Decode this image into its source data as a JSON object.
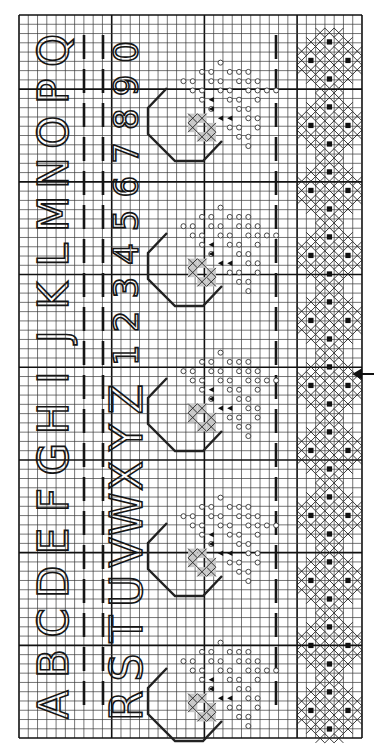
{
  "chart_title": "Cross-stitch alphabet sampler chart (rotated 90°)",
  "grid": {
    "origin_x": 19,
    "origin_y": 15,
    "cell": 9.27,
    "cols": 37,
    "rows": 78,
    "thick_every": 10,
    "line_color": "#3a3a3a",
    "thick_color": "#111111",
    "background": "#ffffff"
  },
  "alphabet_row_1": {
    "letters": [
      "A",
      "B",
      "C",
      "D",
      "E",
      "F",
      "G",
      "H",
      "I",
      "J",
      "K",
      "L",
      "M",
      "N",
      "O",
      "P",
      "Q"
    ],
    "orientation": "rotated -90deg, reading bottom to top",
    "column_center_x": 53
  },
  "alphabet_row_2": {
    "letters": [
      "R",
      "S",
      "T",
      "U",
      "V",
      "W",
      "X",
      "Y",
      "Z"
    ],
    "column_center_x": 126
  },
  "numbers_row": {
    "digits": [
      "1",
      "2",
      "3",
      "4",
      "5",
      "6",
      "7",
      "8",
      "9",
      "0"
    ],
    "column_center_x": 126
  },
  "dashed_guides": [
    {
      "x": 84,
      "from_y": 35,
      "to_y": 705
    },
    {
      "x": 103,
      "from_y": 35,
      "to_y": 705
    },
    {
      "x": 276,
      "from_y": 35,
      "to_y": 705
    }
  ],
  "motif_column": {
    "name": "octagon-with-flower",
    "count": 5,
    "anchors_y": [
      30,
      175,
      320,
      465,
      610
    ],
    "legend": {
      "circle": "open-circle-stitch",
      "triangle": "filled-triangle-stitch",
      "shade": "grey-shaded-stitch"
    }
  },
  "border_column": {
    "name": "diamond-x-motif",
    "count": 11,
    "anchors_y": [
      28,
      93,
      158,
      223,
      288,
      353,
      418,
      483,
      548,
      613,
      678
    ],
    "legend": {
      "x": "cross-stitch",
      "square": "filled-square-stitch"
    }
  },
  "center_marker": {
    "icon": "arrow-left-icon",
    "x": 360,
    "y": 374,
    "label": "center"
  }
}
